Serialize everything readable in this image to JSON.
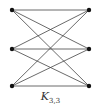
{
  "graph": {
    "name": "K",
    "subscript": "3,3",
    "left_vertices": [
      {
        "id": "a1",
        "x": 12,
        "y": 10
      },
      {
        "id": "a2",
        "x": 12,
        "y": 49
      },
      {
        "id": "a3",
        "x": 12,
        "y": 86
      }
    ],
    "right_vertices": [
      {
        "id": "b1",
        "x": 89,
        "y": 10
      },
      {
        "id": "b2",
        "x": 89,
        "y": 49
      },
      {
        "id": "b3",
        "x": 89,
        "y": 86
      }
    ],
    "edge_color": "#444444",
    "vertex_color": "#111111"
  }
}
